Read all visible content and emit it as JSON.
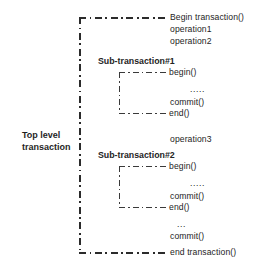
{
  "diagram": {
    "title_label": "Top level\ntransaction",
    "top_level": {
      "label_line1": "Top level",
      "label_line2": "transaction",
      "begin": "Begin transaction()",
      "operation1": "operation1",
      "operation2": "operation2",
      "operation3": "operation3",
      "ellipsis": "...",
      "commit": "commit()",
      "end": "end transaction()"
    },
    "sub_transactions": [
      {
        "title": "Sub-transaction#1",
        "begin": "begin()",
        "ellipsis": ".....",
        "commit": "commit()",
        "end": "end()"
      },
      {
        "title": "Sub-transaction#2",
        "begin": "begin()",
        "ellipsis": ".....",
        "commit": "commit()",
        "end": "end()"
      }
    ],
    "colors": {
      "line": "#2b2b2b",
      "text": "#242424",
      "background": "#ffffff"
    }
  }
}
